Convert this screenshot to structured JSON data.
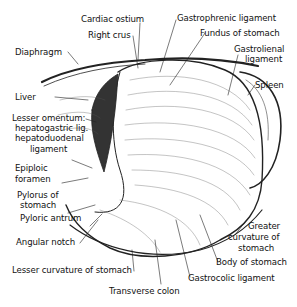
{
  "figure": {
    "labels": {
      "cardiac_ostium": "Cardiac ostium",
      "right_crus": "Right crus",
      "gastrophrenic_ligament": "Gastrophrenic ligament",
      "fundus": "Fundus of stomach",
      "gastrolienal_1": "Gastrolienal",
      "gastrolienal_2": "ligament",
      "spleen": "Spleen",
      "diaphragm": "Diaphragm",
      "liver": "Liver",
      "lesser_omentum_1": "Lesser omentum:",
      "lesser_omentum_2": "hepatogastric lig.",
      "lesser_omentum_3": "hepatoduodenal",
      "lesser_omentum_4": "ligament",
      "epiploic_1": "Epiploic",
      "epiploic_2": "foramen",
      "pylorus_1": "Pylorus of",
      "pylorus_2": "stomach",
      "pyloric_antrum": "Pyloric antrum",
      "angular_notch": "Angular notch",
      "greater_curv_1": "Greater",
      "greater_curv_2": "curvature of",
      "greater_curv_3": "stomach",
      "body": "Body of stomach",
      "gastrocolic": "Gastrocolic ligament",
      "lesser_curvature": "Lesser curvature of stomach",
      "transverse_colon": "Transverse colon"
    }
  }
}
